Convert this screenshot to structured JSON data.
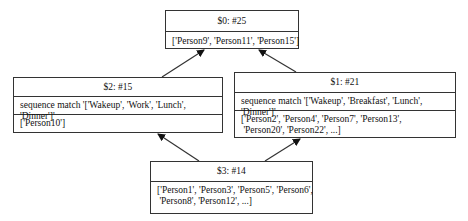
{
  "nodes": {
    "n0": {
      "title": "$0: #25",
      "members": "['Person9', 'Person11', 'Person15']"
    },
    "n2": {
      "title": "$2: #15",
      "condition": "sequence match '['Wakeup', 'Work', 'Lunch', 'Dinner']'",
      "members": "['Person10']"
    },
    "n1": {
      "title": "$1: #21",
      "condition": "sequence match '['Wakeup', 'Breakfast', 'Lunch', 'Dinner']'",
      "members": "['Person2', 'Person4', 'Person7', 'Person13',\n 'Person20', 'Person22', ...]"
    },
    "n3": {
      "title": "$3: #14",
      "members": "['Person1', 'Person3', 'Person5', 'Person6',\n 'Person8', 'Person12', ...]"
    }
  },
  "edges": [
    {
      "from": "$2",
      "to": "$0"
    },
    {
      "from": "$1",
      "to": "$0"
    },
    {
      "from": "$3",
      "to": "$2"
    },
    {
      "from": "$3",
      "to": "$1"
    }
  ],
  "colors": {
    "line": "#333333",
    "background": "#ffffff"
  }
}
